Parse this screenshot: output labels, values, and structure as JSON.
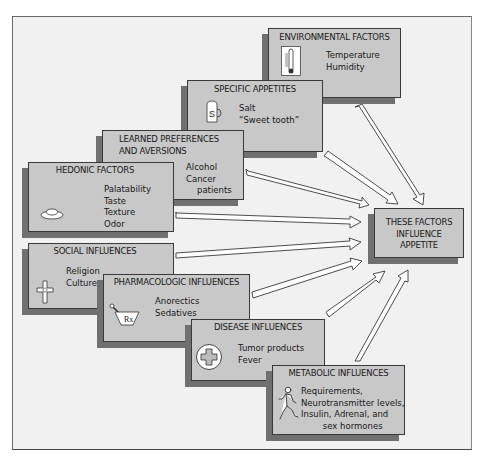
{
  "diagram": {
    "type": "convergent factor diagram",
    "target": {
      "lines": [
        "THESE FACTORS",
        "INFLUENCE",
        "APPETITE"
      ]
    },
    "factors": [
      {
        "id": "environmental",
        "title": "ENVIRONMENTAL FACTORS",
        "icon": "thermometer-icon",
        "items": [
          "Temperature",
          "Humidity"
        ]
      },
      {
        "id": "specific",
        "title": "SPECIFIC APPETITES",
        "icon": "salt-shaker-icon",
        "items": [
          "Salt",
          "“Sweet tooth”"
        ]
      },
      {
        "id": "learned",
        "title_lines": [
          "LEARNED PREFERENCES",
          "AND AVERSIONS"
        ],
        "items": [
          "Alcohol",
          "Cancer",
          "patients"
        ]
      },
      {
        "id": "hedonic",
        "title": "HEDONIC FACTORS",
        "icon": "plate-icon",
        "items": [
          "Palatability",
          "Taste",
          "Texture",
          "Odor"
        ]
      },
      {
        "id": "social",
        "title": "SOCIAL INFLUENCES",
        "icon": "cross-icon",
        "items": [
          "Religion",
          "Culture"
        ]
      },
      {
        "id": "pharmacologic",
        "title": "PHARMACOLOGIC INFLUENCES",
        "icon": "mortar-pestle-rx-icon",
        "icon_text": "Rx",
        "items": [
          "Anorectics",
          "Sedatives"
        ]
      },
      {
        "id": "disease",
        "title": "DISEASE INFLUENCES",
        "icon": "medical-cross-icon",
        "items": [
          "Tumor products",
          "Fever"
        ]
      },
      {
        "id": "metabolic",
        "title": "METABOLIC INFLUENCES",
        "icon": "running-person-icon",
        "items": [
          "Requirements,",
          "Neurotransmitter levels,",
          "Insulin, Adrenal, and",
          "sex hormones"
        ]
      }
    ],
    "colors": {
      "background": "#f1f1f1",
      "box_fill": "#c8c8c8",
      "box_shadow": "#707070",
      "border": "#3a3a3a",
      "arrow_fill": "#ffffff"
    }
  }
}
